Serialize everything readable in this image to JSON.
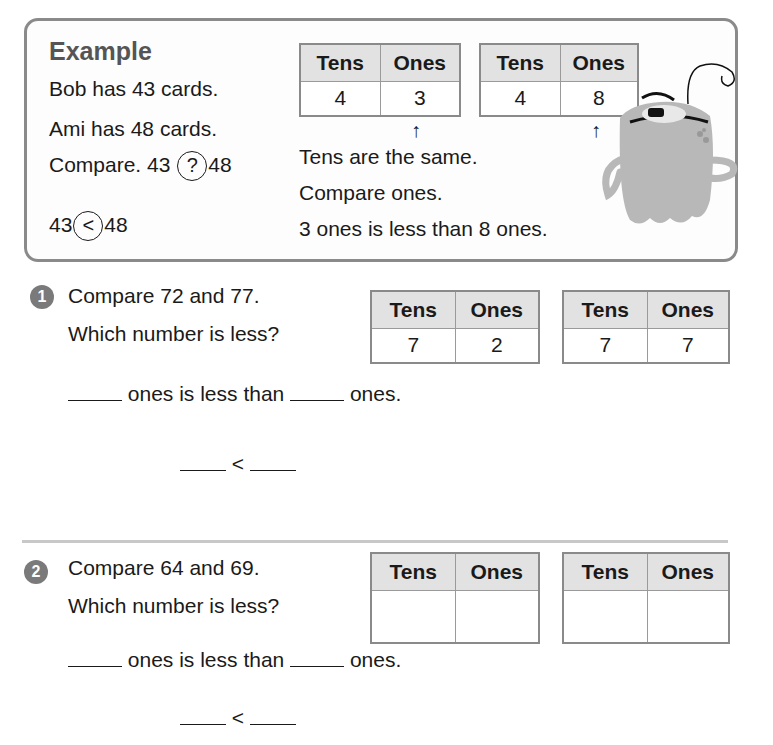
{
  "example": {
    "title": "Example",
    "lines": [
      "Bob has 43 cards.",
      "Ami has 48 cards."
    ],
    "compare_prefix": "Compare. 43",
    "compare_symbol": "?",
    "compare_suffix": "48",
    "answer_left": "43",
    "answer_symbol": "<",
    "answer_right": "48",
    "table_a": {
      "headers": [
        "Tens",
        "Ones"
      ],
      "values": [
        "4",
        "3"
      ]
    },
    "table_b": {
      "headers": [
        "Tens",
        "Ones"
      ],
      "values": [
        "4",
        "8"
      ]
    },
    "arrow": "↑",
    "explanation": [
      "Tens are the same.",
      "Compare ones.",
      "3 ones is less than 8 ones."
    ]
  },
  "problems": [
    {
      "number": "1",
      "line1": "Compare 72 and 77.",
      "line2": "Which number is less?",
      "table_a": {
        "headers": [
          "Tens",
          "Ones"
        ],
        "values": [
          "7",
          "2"
        ]
      },
      "table_b": {
        "headers": [
          "Tens",
          "Ones"
        ],
        "values": [
          "7",
          "7"
        ]
      },
      "sentence_mid": " ones is less than ",
      "sentence_end": " ones.",
      "less_symbol": "<"
    },
    {
      "number": "2",
      "line1": "Compare 64 and 69.",
      "line2": "Which number is less?",
      "table_a": {
        "headers": [
          "Tens",
          "Ones"
        ],
        "values": [
          "",
          ""
        ]
      },
      "table_b": {
        "headers": [
          "Tens",
          "Ones"
        ],
        "values": [
          "",
          ""
        ]
      },
      "sentence_mid": " ones is less than ",
      "sentence_end": " ones.",
      "less_symbol": "<"
    }
  ],
  "colors": {
    "border": "#8a8a8a",
    "header_bg": "#e2e2e2",
    "badge": "#7a7a7a",
    "monster": "#b8b8b8"
  }
}
